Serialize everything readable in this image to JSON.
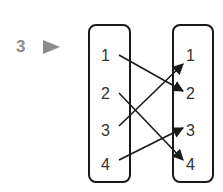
{
  "question": {
    "number": "3",
    "marker": "triangle-right"
  },
  "diagram": {
    "type": "mapping-diagram",
    "domain": [
      "1",
      "2",
      "3",
      "4"
    ],
    "codomain": [
      "1",
      "2",
      "3",
      "4"
    ],
    "mappings": [
      {
        "from": "1",
        "to": "2"
      },
      {
        "from": "2",
        "to": "4"
      },
      {
        "from": "3",
        "to": "1"
      },
      {
        "from": "4",
        "to": "3"
      }
    ]
  },
  "colors": {
    "number": "#8c8c8c",
    "ink": "#1a1a1a"
  }
}
